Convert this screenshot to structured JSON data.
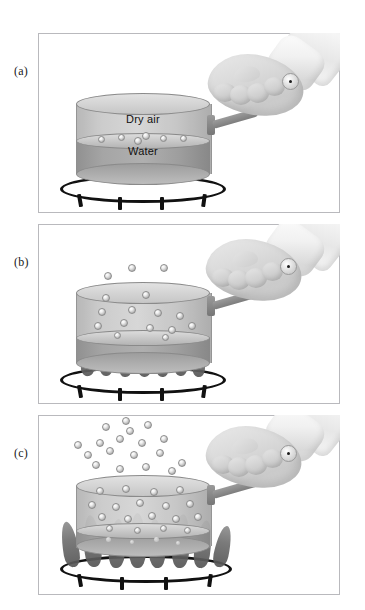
{
  "figure": {
    "background_color": "#ffffff",
    "frame_color": "#b9b9bd",
    "panels": [
      {
        "id": "a",
        "label": "(a)",
        "caption_labels": {
          "vapor_space": "Dry air",
          "liquid": "Water"
        },
        "heat_level": "none",
        "flame_count": 0,
        "molecules_in_vapor": 0,
        "molecules_at_surface": 6,
        "molecules_escaping": 0,
        "description_state": "no heat, molecules only at water surface"
      },
      {
        "id": "b",
        "label": "(b)",
        "caption_labels": {
          "vapor_space": "",
          "liquid": ""
        },
        "heat_level": "low",
        "flame_count": 7,
        "molecules_in_vapor": 11,
        "molecules_at_surface": 5,
        "molecules_escaping": 3,
        "description_state": "low heat, some molecules evaporating above pot"
      },
      {
        "id": "c",
        "label": "(c)",
        "caption_labels": {
          "vapor_space": "",
          "liquid": ""
        },
        "heat_level": "high",
        "flame_count": 8,
        "molecules_in_vapor": 27,
        "molecules_at_surface": 8,
        "molecules_escaping": 20,
        "description_state": "high heat, boiling, dense plume of molecules escaping"
      }
    ],
    "objects": {
      "pot_label": "pot",
      "burner_label": "burner ring",
      "hand_label": "hand holding handle",
      "sleeve_label": "shirt sleeve cuff",
      "molecule_label": "water molecule",
      "flame_label": "flame"
    },
    "colors": {
      "pot_body": "#c9c9c9",
      "water": "#a3a3a3",
      "flame": "#6f6f6f",
      "burner": "#111111",
      "molecule": "#efefef",
      "text": "#111111"
    }
  }
}
